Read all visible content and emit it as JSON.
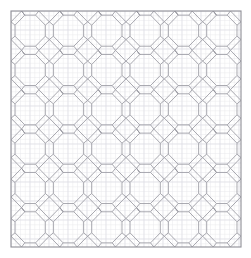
{
  "document": {
    "title": "Octagon and Diamond Tessellation Pattern",
    "type": "technical-line-drawing",
    "width": 251,
    "height": 258,
    "background_color": "#ffffff"
  },
  "graph_paper": {
    "visible": true,
    "minor_spacing": 4.75,
    "major_spacing": 19,
    "minor_color": "#e8e8ec",
    "major_color": "#dcdce2",
    "minor_width": 0.5,
    "major_width": 0.6
  },
  "frame": {
    "x": 11,
    "y": 11,
    "width": 230,
    "height": 236,
    "stroke": "#8e8e96",
    "stroke_width": 1.1,
    "fill": "none"
  },
  "pattern": {
    "name": "octagon-diamond-tessellation",
    "stroke": "#9a9aa2",
    "stroke_width": 0.85,
    "fill": "none",
    "columns": 6,
    "rows": 6,
    "cell_width": 38.333,
    "cell_height": 39.333,
    "origin_x": 11,
    "origin_y": 11,
    "octagon_inset_ratio": 0.105,
    "octagon_corner_ratio": 0.255,
    "diamond_half_ratio": 0.145,
    "node_dot_color": "#9a9aa2",
    "node_dot_radius": 0.75
  },
  "colors": {
    "paper": "#ffffff",
    "line_primary": "#9a9aa2",
    "line_frame": "#8e8e96",
    "grid_minor": "#e8e8ec",
    "grid_major": "#dcdce2"
  }
}
